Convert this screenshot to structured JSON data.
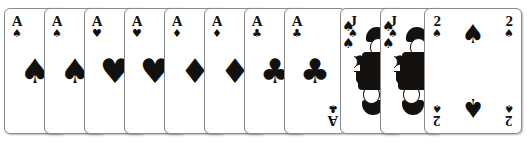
{
  "scene": {
    "description": "Overlapping fan of playing cards on a white background",
    "background_color": "#ffffff",
    "card_face_color": "#ffffff",
    "card_border_color": "#8a8a8a",
    "ink_color": "#111111",
    "card_count": 11,
    "card_width": 62,
    "card_height": 126,
    "card_overlap_step": 40
  },
  "glyphs": {
    "spade": "♠",
    "heart": "♥",
    "diamond": "♦",
    "club": "♣"
  },
  "cards": [
    {
      "index": 1,
      "rank": "A",
      "suit_name": "spades",
      "suit": "♠",
      "color": "#111111",
      "layout": "ace",
      "left": 4,
      "visible_width": 40,
      "z": 1
    },
    {
      "index": 2,
      "rank": "A",
      "suit_name": "spades",
      "suit": "♠",
      "color": "#111111",
      "layout": "ace",
      "left": 44,
      "visible_width": 40,
      "z": 2
    },
    {
      "index": 3,
      "rank": "A",
      "suit_name": "hearts",
      "suit": "♥",
      "color": "#111111",
      "layout": "ace",
      "left": 84,
      "visible_width": 40,
      "z": 3
    },
    {
      "index": 4,
      "rank": "A",
      "suit_name": "hearts",
      "suit": "♥",
      "color": "#111111",
      "layout": "ace",
      "left": 124,
      "visible_width": 40,
      "z": 4
    },
    {
      "index": 5,
      "rank": "A",
      "suit_name": "diamonds",
      "suit": "♦",
      "color": "#111111",
      "layout": "ace",
      "left": 164,
      "visible_width": 40,
      "z": 5
    },
    {
      "index": 6,
      "rank": "A",
      "suit_name": "diamonds",
      "suit": "♦",
      "color": "#111111",
      "layout": "ace",
      "left": 204,
      "visible_width": 40,
      "z": 6
    },
    {
      "index": 7,
      "rank": "A",
      "suit_name": "clubs",
      "suit": "♣",
      "color": "#111111",
      "layout": "ace",
      "left": 244,
      "visible_width": 40,
      "z": 7
    },
    {
      "index": 8,
      "rank": "A",
      "suit_name": "clubs",
      "suit": "♣",
      "color": "#111111",
      "layout": "ace",
      "left": 284,
      "visible_width": 40,
      "z": 8
    },
    {
      "index": 9,
      "rank": "J",
      "suit_name": "spades",
      "suit": "♠",
      "color": "#111111",
      "layout": "court",
      "left": 340,
      "visible_width": 40,
      "z": 9
    },
    {
      "index": 10,
      "rank": "J",
      "suit_name": "spades",
      "suit": "♠",
      "color": "#111111",
      "layout": "court",
      "left": 380,
      "visible_width": 40,
      "z": 10
    },
    {
      "index": 11,
      "rank": "2",
      "suit_name": "spades",
      "suit": "♠",
      "color": "#111111",
      "layout": "two",
      "left": 424,
      "visible_width": 98,
      "z": 11
    }
  ]
}
